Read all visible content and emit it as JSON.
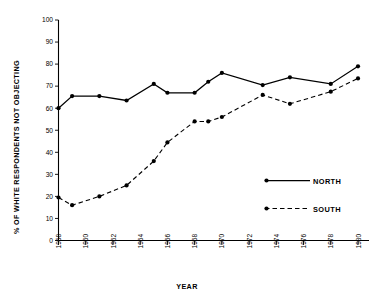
{
  "chart_data": {
    "type": "line",
    "title": "",
    "xlabel": "YEAR",
    "ylabel": "% OF WHITE RESPONDENTS NOT OBJECTING",
    "xlim": [
      1958,
      1980
    ],
    "ylim": [
      0,
      100
    ],
    "grid": false,
    "legend_position": "middle-right",
    "y_ticks": [
      0,
      10,
      20,
      30,
      40,
      50,
      60,
      70,
      80,
      90,
      100
    ],
    "y_tick_labels": [
      "0",
      "10",
      "20",
      "30",
      "40",
      "50",
      "60",
      "70",
      "80",
      "90",
      "100"
    ],
    "x_ticks": [
      1958,
      1960,
      1962,
      1964,
      1966,
      1968,
      1970,
      1972,
      1974,
      1976,
      1978,
      1980
    ],
    "x_tick_labels": [
      "1958",
      "1960",
      "1962",
      "1964",
      "1966",
      "1968",
      "1970",
      "1972",
      "1974",
      "1976",
      "1978",
      "1980"
    ],
    "x": [
      1958,
      1959,
      1961,
      1963,
      1965,
      1966,
      1968,
      1969,
      1970,
      1973,
      1975,
      1978,
      1980
    ],
    "series": [
      {
        "name": "NORTH",
        "style": "solid",
        "marker": "circle",
        "values": [
          60,
          65.5,
          65.5,
          63.5,
          71,
          67,
          67,
          72,
          76,
          70.5,
          74,
          71,
          79
        ]
      },
      {
        "name": "SOUTH",
        "style": "dashed",
        "marker": "circle",
        "values": [
          19.5,
          16,
          20,
          25,
          36,
          44.5,
          54,
          54,
          56,
          66,
          62,
          67.5,
          73.5
        ]
      }
    ]
  },
  "legend": {
    "entries": [
      {
        "label": "NORTH",
        "style": "solid"
      },
      {
        "label": "SOUTH",
        "style": "dashed"
      }
    ]
  }
}
